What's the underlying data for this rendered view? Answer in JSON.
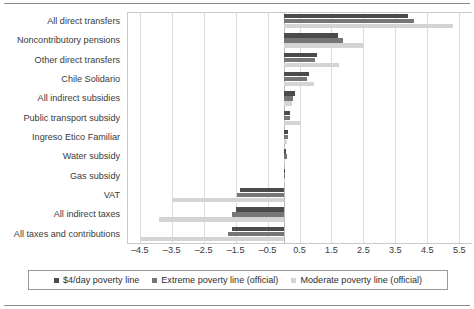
{
  "chart_data": {
    "type": "bar",
    "orientation": "horizontal",
    "title": "",
    "subtitle": "",
    "xlabel": "",
    "ylabel": "",
    "xlim": [
      -4.9,
      5.9
    ],
    "xticks": [
      "–4.5",
      "–3.5",
      "–2.5",
      "–1.5",
      "–0.5",
      "0.5",
      "1.5",
      "2.5",
      "3.5",
      "4.5",
      "5.5"
    ],
    "xtick_values": [
      -4.5,
      -3.5,
      -2.5,
      -1.5,
      -0.5,
      0.5,
      1.5,
      2.5,
      3.5,
      4.5,
      5.5
    ],
    "grid": true,
    "grid_axis": "x",
    "legend_position": "bottom",
    "categories": [
      "All direct transfers",
      "Noncontributory pensions",
      "Other direct transfers",
      "Chile Solidario",
      "All indirect subsidies",
      "Public transport subsidy",
      "Ingreso Etico Familiar",
      "Water subsidy",
      "Gas subsidy",
      "VAT",
      "All indirect taxes",
      "All taxes and contributions"
    ],
    "series": [
      {
        "name": "$4/day poverty line",
        "color": "#4b4b4b",
        "values": [
          3.9,
          1.7,
          1.05,
          0.8,
          0.35,
          0.2,
          0.15,
          0.07,
          0.01,
          -1.35,
          -1.5,
          -1.6
        ]
      },
      {
        "name": "Extreme poverty line (official)",
        "color": "#767676",
        "values": [
          4.1,
          1.85,
          1.0,
          0.75,
          0.3,
          0.2,
          0.15,
          0.1,
          0.01,
          -1.45,
          -1.6,
          -1.75
        ]
      },
      {
        "name": "Moderate poverty line (official)",
        "color": "#d4d4d4",
        "values": [
          5.3,
          2.5,
          1.75,
          0.95,
          0.25,
          0.55,
          0.12,
          0.05,
          0.01,
          -3.5,
          -3.9,
          -4.45
        ]
      }
    ]
  },
  "legend": {
    "items": [
      {
        "label": "$4/day poverty line",
        "color": "#4b4b4b"
      },
      {
        "label": "Extreme poverty line (official)",
        "color": "#767676"
      },
      {
        "label": "Moderate poverty line (official)",
        "color": "#d4d4d4"
      }
    ]
  },
  "colors": {
    "series_dark": "#4b4b4b",
    "series_medium": "#767676",
    "series_light": "#d4d4d4",
    "gridline": "#dcdcdc",
    "zero_line": "#b9b9b9",
    "frame_rule": "#8b8b8b",
    "text": "#3a3a3a"
  }
}
